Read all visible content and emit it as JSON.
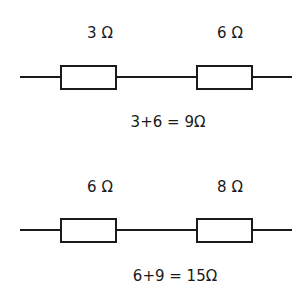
{
  "circuits": [
    {
      "resistors": [
        {
          "label": "3 Ω"
        },
        {
          "label": "6 Ω"
        }
      ],
      "formula": "3+6 = 9Ω"
    },
    {
      "resistors": [
        {
          "label": "6 Ω"
        },
        {
          "label": "8 Ω"
        }
      ],
      "formula": "6+9 = 15Ω"
    }
  ],
  "colors": {
    "line": "#1a1a1a",
    "background": "#ffffff"
  }
}
